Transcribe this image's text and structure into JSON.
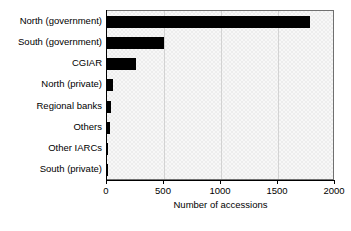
{
  "chart_data": {
    "type": "bar",
    "orientation": "horizontal",
    "title": "",
    "xlabel": "Number of accessions",
    "ylabel": "",
    "categories": [
      "North (government)",
      "South (government)",
      "CGIAR",
      "North (private)",
      "Regional banks",
      "Others",
      "Other IARCs",
      "South (private)"
    ],
    "values": [
      1780,
      500,
      250,
      55,
      35,
      30,
      12,
      4
    ],
    "xlim": [
      0,
      2000
    ],
    "xticks": [
      0,
      500,
      1000,
      1500,
      2000
    ],
    "xtick_labels": [
      "0",
      "500",
      "1000",
      "1500",
      "2000"
    ],
    "grid": "vertical",
    "legend": "none",
    "bar_color": "#000000",
    "plot_background": "#ededed",
    "axis_color": "#000000"
  }
}
